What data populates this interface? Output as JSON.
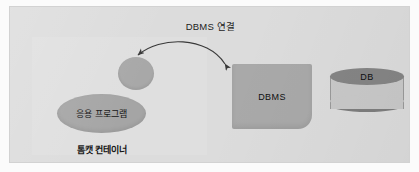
{
  "figure": {
    "title": "DBMS 연결",
    "title_icon": "diagram-title"
  },
  "nodes": {
    "small_node": {
      "label": "",
      "shape": "ellipse"
    },
    "application": {
      "label": "응용 프로그램",
      "shape": "ellipse"
    },
    "container_caption": "톰캣 컨테이너",
    "dbms": {
      "label": "DBMS",
      "shape": "rounded-rectangle"
    },
    "database": {
      "label": "DB",
      "shape": "cylinder"
    }
  },
  "connector": {
    "name": "bidirectional-arrow",
    "from": "응용 프로그램",
    "to": "DBMS",
    "style": "curved double-headed"
  },
  "colors": {
    "panel_background": "#dcdcdc",
    "node_fill": "#a5a5a5",
    "dbms_fill": "#a9a9a9",
    "db_top_fill": "#858585",
    "db_body_fill": "#c9c9c9",
    "db_rim_fill": "#7e7e7e",
    "text": "#141414",
    "arrow": "#3a3a3a"
  }
}
